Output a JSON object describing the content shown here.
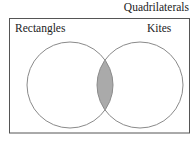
{
  "diagram": {
    "type": "venn",
    "universe": {
      "label": "Quadrilaterals"
    },
    "sets": [
      {
        "label": "Rectangles",
        "cx": 70,
        "cy": 85,
        "r": 43
      },
      {
        "label": "Kites",
        "cx": 140,
        "cy": 85,
        "r": 43
      }
    ],
    "shaded_region": "intersection",
    "colors": {
      "outline": "#8a8a8a",
      "frame": "#555555",
      "shade": "#aaaaaa"
    }
  }
}
